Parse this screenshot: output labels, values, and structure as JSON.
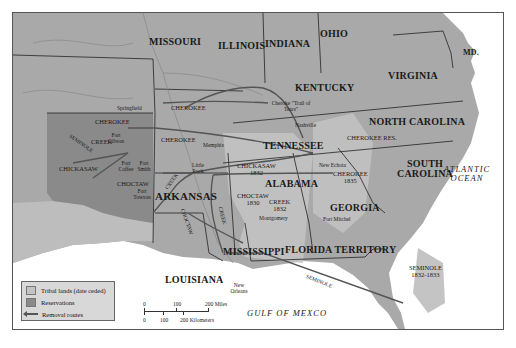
{
  "map": {
    "title": "Indian Removal Routes",
    "colors": {
      "land": "#a9a9a9",
      "tribal_lands": "#c4c4c4",
      "reservations": "#8a8a8a",
      "water": "#ffffff",
      "routes": "#555555",
      "borders": "#222222"
    },
    "states": [
      {
        "name": "MISSOURI"
      },
      {
        "name": "ILLINOIS"
      },
      {
        "name": "INDIANA"
      },
      {
        "name": "OHIO"
      },
      {
        "name": "KENTUCKY"
      },
      {
        "name": "VIRGINIA"
      },
      {
        "name": "MD."
      },
      {
        "name": "NORTH CAROLINA"
      },
      {
        "name": "TENNESSEE"
      },
      {
        "name": "SOUTH CAROLINA"
      },
      {
        "name": "ARKANSAS"
      },
      {
        "name": "ALABAMA"
      },
      {
        "name": "GEORGIA"
      },
      {
        "name": "MISSISSIPPI"
      },
      {
        "name": "LOUISIANA"
      },
      {
        "name": "FLORIDA TERRITORY"
      }
    ],
    "tribal_labels": [
      {
        "name": "CHEROKEE"
      },
      {
        "name": "CREEK"
      },
      {
        "name": "SEMINOLE"
      },
      {
        "name": "CHICKASAW"
      },
      {
        "name": "CHOCTAW"
      },
      {
        "name": "CHICKASAW",
        "date": "1832"
      },
      {
        "name": "CHOCTAW",
        "date": "1830"
      },
      {
        "name": "CREEK",
        "date": "1832"
      },
      {
        "name": "CHEROKEE",
        "date": "1835"
      },
      {
        "name": "CHEROKEE RES."
      },
      {
        "name": "SEMINOLE",
        "date": "1832-1833"
      }
    ],
    "route_labels": [
      {
        "name": "CHEROKEE",
        "where": "Springfield"
      },
      {
        "name": "CHEROKEE",
        "where": "Fort Gibson"
      },
      {
        "name": "CREEK",
        "where": "Arkansas north"
      },
      {
        "name": "CREEK",
        "where": "Mississippi"
      },
      {
        "name": "CHOCTAW",
        "where": "Arkansas"
      },
      {
        "name": "SEMINOLE",
        "where": "Gulf"
      },
      {
        "name": "Cheroke \"Trail of Tears\"",
        "where": "Kentucky"
      }
    ],
    "cities": [
      {
        "name": "Springfield"
      },
      {
        "name": "Fort Gibson"
      },
      {
        "name": "Fort Coffee"
      },
      {
        "name": "Fort Smith"
      },
      {
        "name": "Fort Towson"
      },
      {
        "name": "Little Rock"
      },
      {
        "name": "Memphis"
      },
      {
        "name": "Nashville"
      },
      {
        "name": "New Echota"
      },
      {
        "name": "Montgomery"
      },
      {
        "name": "Fort Mitchel"
      },
      {
        "name": "New Orleans"
      }
    ],
    "water_labels": [
      {
        "name": "ATLANTIC OCEAN"
      },
      {
        "name": "GULF OF MEXCO"
      }
    ]
  },
  "legend": {
    "items": [
      {
        "label": "Tribal lands (date ceded)",
        "color": "#c4c4c4"
      },
      {
        "label": "Reservations",
        "color": "#8a8a8a"
      },
      {
        "label": "Removal routes",
        "color": "#555555"
      }
    ]
  },
  "scale": {
    "miles": [
      "0",
      "100",
      "200 Miles"
    ],
    "km": [
      "0",
      "100",
      "200 Kilometers"
    ]
  }
}
